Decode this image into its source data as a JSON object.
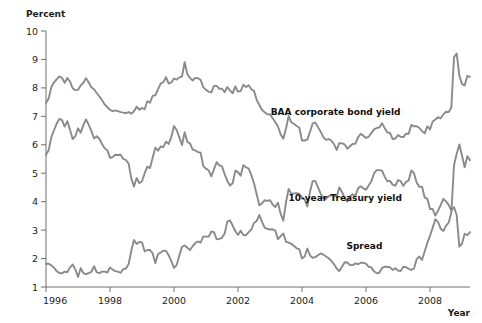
{
  "chart_data": {
    "type": "line",
    "title": "",
    "subtitle": "",
    "ylabel": "Percent",
    "xlabel": "Year",
    "ylim": [
      1,
      10
    ],
    "xlim": [
      1996.0,
      2009.25
    ],
    "grid": false,
    "legend_position": "inline-annotations",
    "y_ticks": [
      1,
      2,
      3,
      4,
      5,
      6,
      7,
      8,
      9,
      10
    ],
    "y_tick_labels": [
      "1",
      "2",
      "3",
      "4",
      "5",
      "6",
      "7",
      "8",
      "9",
      "10"
    ],
    "x_ticks": [
      1996,
      1998,
      2000,
      2002,
      2004,
      2006,
      2008
    ],
    "x_tick_labels": [
      "1996",
      "1998",
      "2000",
      "2002",
      "2004",
      "2006",
      "2008"
    ],
    "line_color": "#8a8a8a",
    "axis_color": "#6f6f6f",
    "annotations": [
      {
        "text": "BAA corporate bond yield",
        "x": 2005.05,
        "y": 7.05,
        "series": "BAA corporate bond yield"
      },
      {
        "text": "10-year Treasury yield",
        "x": 2005.35,
        "y": 4.02,
        "series": "10-year Treasury yield"
      },
      {
        "text": "Spread",
        "x": 2005.95,
        "y": 2.33,
        "series": "Spread"
      }
    ],
    "x": [
      1996.0,
      1996.083,
      1996.167,
      1996.25,
      1996.333,
      1996.417,
      1996.5,
      1996.583,
      1996.667,
      1996.75,
      1996.833,
      1996.917,
      1997.0,
      1997.083,
      1997.167,
      1997.25,
      1997.333,
      1997.417,
      1997.5,
      1997.583,
      1997.667,
      1997.75,
      1997.833,
      1997.917,
      1998.0,
      1998.083,
      1998.167,
      1998.25,
      1998.333,
      1998.417,
      1998.5,
      1998.583,
      1998.667,
      1998.75,
      1998.833,
      1998.917,
      1999.0,
      1999.083,
      1999.167,
      1999.25,
      1999.333,
      1999.417,
      1999.5,
      1999.583,
      1999.667,
      1999.75,
      1999.833,
      1999.917,
      2000.0,
      2000.083,
      2000.167,
      2000.25,
      2000.333,
      2000.417,
      2000.5,
      2000.583,
      2000.667,
      2000.75,
      2000.833,
      2000.917,
      2001.0,
      2001.083,
      2001.167,
      2001.25,
      2001.333,
      2001.417,
      2001.5,
      2001.583,
      2001.667,
      2001.75,
      2001.833,
      2001.917,
      2002.0,
      2002.083,
      2002.167,
      2002.25,
      2002.333,
      2002.417,
      2002.5,
      2002.583,
      2002.667,
      2002.75,
      2002.833,
      2002.917,
      2003.0,
      2003.083,
      2003.167,
      2003.25,
      2003.333,
      2003.417,
      2003.5,
      2003.583,
      2003.667,
      2003.75,
      2003.833,
      2003.917,
      2004.0,
      2004.083,
      2004.167,
      2004.25,
      2004.333,
      2004.417,
      2004.5,
      2004.583,
      2004.667,
      2004.75,
      2004.833,
      2004.917,
      2005.0,
      2005.083,
      2005.167,
      2005.25,
      2005.333,
      2005.417,
      2005.5,
      2005.583,
      2005.667,
      2005.75,
      2005.833,
      2005.917,
      2006.0,
      2006.083,
      2006.167,
      2006.25,
      2006.333,
      2006.417,
      2006.5,
      2006.583,
      2006.667,
      2006.75,
      2006.833,
      2006.917,
      2007.0,
      2007.083,
      2007.167,
      2007.25,
      2007.333,
      2007.417,
      2007.5,
      2007.583,
      2007.667,
      2007.75,
      2007.833,
      2007.917,
      2008.0,
      2008.083,
      2008.167,
      2008.25,
      2008.333,
      2008.417,
      2008.5,
      2008.583,
      2008.667,
      2008.75,
      2008.833,
      2008.917,
      2009.0,
      2009.083,
      2009.167,
      2009.25
    ],
    "series": [
      {
        "name": "BAA corporate bond yield",
        "color": "#8a8a8a",
        "values": [
          7.47,
          7.63,
          8.03,
          8.19,
          8.3,
          8.4,
          8.35,
          8.18,
          8.35,
          8.22,
          7.99,
          7.92,
          7.93,
          8.08,
          8.18,
          8.34,
          8.2,
          8.02,
          7.95,
          7.82,
          7.7,
          7.57,
          7.42,
          7.32,
          7.23,
          7.18,
          7.21,
          7.18,
          7.15,
          7.13,
          7.11,
          7.15,
          7.09,
          7.18,
          7.34,
          7.23,
          7.29,
          7.25,
          7.53,
          7.48,
          7.72,
          7.74,
          7.95,
          8.15,
          8.2,
          8.38,
          8.15,
          8.19,
          8.33,
          8.29,
          8.37,
          8.4,
          8.9,
          8.48,
          8.35,
          8.26,
          8.35,
          8.34,
          8.28,
          8.02,
          7.93,
          7.87,
          7.84,
          8.07,
          8.07,
          7.97,
          7.97,
          7.85,
          8.03,
          7.91,
          7.81,
          8.05,
          7.87,
          7.89,
          8.11,
          8.03,
          8.09,
          7.95,
          7.9,
          7.58,
          7.4,
          7.23,
          7.14,
          7.07,
          7.07,
          6.93,
          6.79,
          6.64,
          6.36,
          6.21,
          6.57,
          7.01,
          6.79,
          6.73,
          6.66,
          6.6,
          6.15,
          6.15,
          6.18,
          6.46,
          6.75,
          6.78,
          6.62,
          6.46,
          6.27,
          6.17,
          6.2,
          6.15,
          6.02,
          5.82,
          6.06,
          6.05,
          6.01,
          5.86,
          5.95,
          6.03,
          6.03,
          6.26,
          6.39,
          6.32,
          6.24,
          6.28,
          6.41,
          6.54,
          6.59,
          6.61,
          6.76,
          6.59,
          6.43,
          6.42,
          6.2,
          6.22,
          6.34,
          6.28,
          6.27,
          6.39,
          6.39,
          6.7,
          6.65,
          6.65,
          6.59,
          6.48,
          6.4,
          6.65,
          6.54,
          6.82,
          6.89,
          6.97,
          6.93,
          7.07,
          7.16,
          7.15,
          7.31,
          9.08,
          9.21,
          8.43,
          8.14,
          8.08,
          8.42,
          8.39
        ]
      },
      {
        "name": "10-year Treasury yield",
        "color": "#8a8a8a",
        "values": [
          5.65,
          5.81,
          6.27,
          6.51,
          6.74,
          6.91,
          6.87,
          6.64,
          6.83,
          6.53,
          6.2,
          6.3,
          6.58,
          6.42,
          6.69,
          6.89,
          6.71,
          6.49,
          6.22,
          6.3,
          6.21,
          6.03,
          5.88,
          5.81,
          5.54,
          5.57,
          5.65,
          5.64,
          5.65,
          5.5,
          5.46,
          5.34,
          4.81,
          4.53,
          4.83,
          4.65,
          4.72,
          5.0,
          5.23,
          5.18,
          5.54,
          5.9,
          5.79,
          5.94,
          5.92,
          6.11,
          6.03,
          6.28,
          6.66,
          6.52,
          6.26,
          5.99,
          6.44,
          6.1,
          6.05,
          5.83,
          5.8,
          5.74,
          5.72,
          5.24,
          5.16,
          5.1,
          4.89,
          5.14,
          5.39,
          5.28,
          5.24,
          4.97,
          4.73,
          4.57,
          4.65,
          5.09,
          5.04,
          4.91,
          5.28,
          5.21,
          5.16,
          4.93,
          4.65,
          4.26,
          3.87,
          3.94,
          4.05,
          4.03,
          4.05,
          3.9,
          3.81,
          3.96,
          3.57,
          3.33,
          3.98,
          4.45,
          4.27,
          4.29,
          4.3,
          4.27,
          4.15,
          4.08,
          3.83,
          4.35,
          4.72,
          4.73,
          4.5,
          4.28,
          4.13,
          4.1,
          4.19,
          4.23,
          4.22,
          4.17,
          4.5,
          4.34,
          4.14,
          4.0,
          4.18,
          4.26,
          4.2,
          4.46,
          4.54,
          4.47,
          4.42,
          4.57,
          4.72,
          4.99,
          5.11,
          5.11,
          5.09,
          4.88,
          4.72,
          4.73,
          4.6,
          4.56,
          4.76,
          4.72,
          4.56,
          4.69,
          4.75,
          5.1,
          5.0,
          4.67,
          4.52,
          4.53,
          4.15,
          4.1,
          3.74,
          3.74,
          3.51,
          3.68,
          3.88,
          4.1,
          4.01,
          3.89,
          3.69,
          3.81,
          3.53,
          2.42,
          2.52,
          2.87,
          2.82,
          2.93
        ]
      },
      {
        "name": "Spread",
        "color": "#8a8a8a",
        "values": [
          1.82,
          1.82,
          1.76,
          1.68,
          1.56,
          1.49,
          1.48,
          1.54,
          1.52,
          1.69,
          1.79,
          1.62,
          1.35,
          1.66,
          1.49,
          1.45,
          1.49,
          1.53,
          1.73,
          1.52,
          1.49,
          1.54,
          1.54,
          1.51,
          1.69,
          1.61,
          1.56,
          1.54,
          1.5,
          1.63,
          1.65,
          1.81,
          2.28,
          2.65,
          2.51,
          2.58,
          2.57,
          2.25,
          2.3,
          2.3,
          2.18,
          1.84,
          2.16,
          2.21,
          2.28,
          2.27,
          2.12,
          1.91,
          1.67,
          1.77,
          2.11,
          2.41,
          2.46,
          2.38,
          2.3,
          2.43,
          2.55,
          2.6,
          2.56,
          2.78,
          2.77,
          2.77,
          2.95,
          2.93,
          2.68,
          2.69,
          2.73,
          2.88,
          3.3,
          3.34,
          3.16,
          2.96,
          2.83,
          2.98,
          2.83,
          2.82,
          2.93,
          3.02,
          3.25,
          3.32,
          3.53,
          3.29,
          3.09,
          3.04,
          3.02,
          3.03,
          2.98,
          2.68,
          2.79,
          2.88,
          2.59,
          2.56,
          2.52,
          2.44,
          2.36,
          2.33,
          2.0,
          2.07,
          2.35,
          2.11,
          2.03,
          2.05,
          2.12,
          2.18,
          2.14,
          2.07,
          2.01,
          1.92,
          1.8,
          1.65,
          1.56,
          1.71,
          1.87,
          1.86,
          1.77,
          1.77,
          1.83,
          1.8,
          1.85,
          1.85,
          1.82,
          1.71,
          1.69,
          1.55,
          1.48,
          1.5,
          1.67,
          1.71,
          1.71,
          1.69,
          1.6,
          1.66,
          1.58,
          1.56,
          1.71,
          1.7,
          1.64,
          1.6,
          1.65,
          1.98,
          2.07,
          1.95,
          2.25,
          2.55,
          2.8,
          3.08,
          3.38,
          3.29,
          3.05,
          2.97,
          3.15,
          3.26,
          3.62,
          5.27,
          5.68,
          6.01,
          5.62,
          5.21,
          5.6,
          5.46
        ]
      }
    ]
  }
}
